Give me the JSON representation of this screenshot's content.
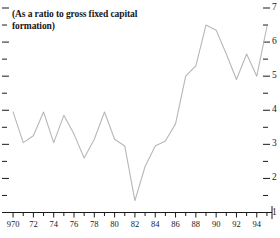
{
  "chart_data": {
    "type": "line",
    "title": "(As a ratio to gross fixed capital formation)",
    "xlabel": "",
    "ylabel": "",
    "grid": false,
    "legend": "none",
    "xlim": [
      1969.5,
      1995.5
    ],
    "ylim": [
      1,
      7
    ],
    "y_axis_position": "right",
    "y_major_ticks": [
      1,
      2,
      3,
      4,
      5,
      6,
      7
    ],
    "y_minor_ticks": [
      1.5,
      2.5,
      3.5,
      4.5,
      5.5,
      6.5
    ],
    "x_tick_labels": [
      "970",
      "72",
      "74",
      "76",
      "78",
      "80",
      "82",
      "84",
      "86",
      "88",
      "90",
      "92",
      "94"
    ],
    "x_tick_values": [
      1970,
      1972,
      1974,
      1976,
      1978,
      1980,
      1982,
      1984,
      1986,
      1988,
      1990,
      1992,
      1994
    ],
    "x": [
      1970,
      1971,
      1972,
      1973,
      1974,
      1975,
      1976,
      1977,
      1978,
      1979,
      1980,
      1981,
      1982,
      1983,
      1984,
      1985,
      1986,
      1987,
      1988,
      1989,
      1990,
      1991,
      1992,
      1993,
      1994,
      1995
    ],
    "values": [
      3.95,
      3.05,
      3.25,
      3.95,
      3.05,
      3.85,
      3.3,
      2.6,
      3.15,
      3.95,
      3.15,
      2.95,
      1.35,
      2.35,
      2.95,
      3.1,
      3.6,
      5.0,
      5.3,
      6.5,
      6.35,
      5.65,
      4.9,
      5.65,
      5.0,
      6.45
    ],
    "line_color": "#b7b7b7",
    "axis_color": "#1a1a1a",
    "background_color": "#ffffff"
  }
}
